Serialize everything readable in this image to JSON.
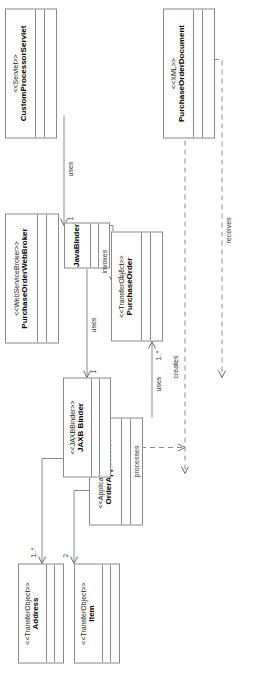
{
  "diagram": {
    "type": "uml-class-diagram",
    "orientation": "rotated-90-counterclockwise",
    "canvas": {
      "width": 266,
      "height": 673
    }
  },
  "classes": [
    {
      "id": "address",
      "stereotype": "<<TransferObject>>",
      "name": "Address"
    },
    {
      "id": "item",
      "stereotype": "<<TransferObject>>",
      "name": "Item"
    },
    {
      "id": "order_app_service",
      "stereotype": "<<ApplicationService>>",
      "name": "OrderAppService"
    },
    {
      "id": "purchase_order",
      "stereotype": "<<TransferObject>>",
      "name": "PurchaseOrder"
    },
    {
      "id": "purchase_order_web_broker",
      "stereotype": "<<WebServiceBroker>>",
      "name": "PurchaseOrderWebBroker"
    },
    {
      "id": "java_binder",
      "stereotype": "",
      "name": "JavaBinder"
    },
    {
      "id": "jaxb_binder",
      "stereotype": "<<JAXBBinder>>",
      "name": "JAXB Binder"
    },
    {
      "id": "custom_processor_servlet",
      "stereotype": "<<Servlet>>",
      "name": "CustomProcessorServlet"
    },
    {
      "id": "purchase_order_document",
      "stereotype": "<<XML>>",
      "name": "PurchaseOrderDocument"
    }
  ],
  "relationships": [
    {
      "id": "po_to_address",
      "from": "purchase_order",
      "to": "address",
      "label": "",
      "multiplicity": "2",
      "style": "solid",
      "arrow": "open"
    },
    {
      "id": "po_to_item",
      "from": "purchase_order",
      "to": "item",
      "label": "",
      "multiplicity": "1..*",
      "style": "solid",
      "arrow": "open"
    },
    {
      "id": "oas_uses_po",
      "from": "order_app_service",
      "to": "purchase_order",
      "label": "uses",
      "multiplicity": "1..*",
      "style": "solid",
      "arrow": "open"
    },
    {
      "id": "broker_invokes_oas",
      "from": "purchase_order_web_broker",
      "to": "order_app_service",
      "label": "invokes",
      "multiplicity": "1..*",
      "style": "solid",
      "arrow": "open"
    },
    {
      "id": "pod_creates_po",
      "from": "purchase_order_document",
      "to": "purchase_order",
      "label": "creates",
      "multiplicity": "",
      "style": "dashed",
      "arrow": "open"
    },
    {
      "id": "javabinder_uses_jaxb",
      "from": "java_binder",
      "to": "jaxb_binder",
      "label": "uses",
      "multiplicity": "1",
      "style": "solid",
      "arrow": "open"
    },
    {
      "id": "servlet_uses_javabinder",
      "from": "custom_processor_servlet",
      "to": "java_binder",
      "label": "uses",
      "multiplicity": "1",
      "style": "solid",
      "arrow": "open"
    },
    {
      "id": "jaxb_processes_pod",
      "from": "jaxb_binder",
      "to": "purchase_order_document",
      "label": "processes",
      "multiplicity": "",
      "style": "dashed",
      "arrow": "open"
    },
    {
      "id": "servlet_receives_pod",
      "from": "custom_processor_servlet",
      "to": "purchase_order_document",
      "label": "receives",
      "multiplicity": "",
      "style": "dashed",
      "arrow": "open"
    }
  ],
  "colors": {
    "background": "#ffffff",
    "box_border": "#8a8a8a",
    "line": "#8a8a8a",
    "text": "#000000",
    "label_text": "#333333"
  }
}
